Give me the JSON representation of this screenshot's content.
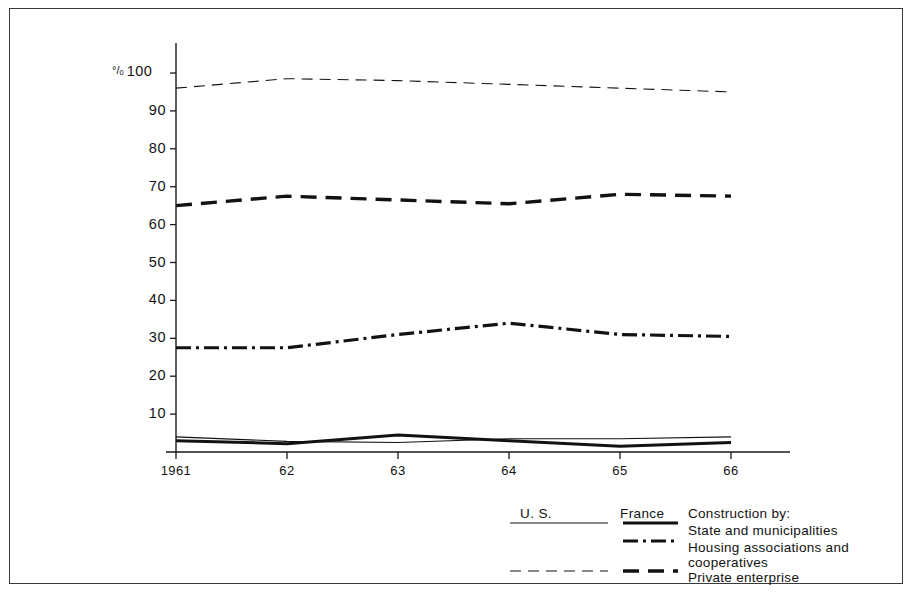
{
  "chart_data": {
    "type": "line",
    "title": "",
    "xlabel": "",
    "ylabel": "%",
    "y_axis_unit_label": "%",
    "categories": [
      "1961",
      "62",
      "63",
      "64",
      "65",
      "66"
    ],
    "x": [
      1961,
      1962,
      1963,
      1964,
      1965,
      1966
    ],
    "ylim": [
      0,
      100
    ],
    "yticks": [
      10,
      20,
      30,
      40,
      50,
      60,
      70,
      80,
      90,
      100
    ],
    "ytick_labels": [
      "10",
      "20",
      "30",
      "40",
      "50",
      "60",
      "70",
      "80",
      "90",
      "100"
    ],
    "grid": false,
    "legend_position": "bottom-right",
    "series": [
      {
        "name": "U.S. — State and municipalities",
        "country": "U.S.",
        "category": "State and municipalities",
        "style": "thin-solid",
        "values": [
          4.0,
          2.8,
          2.5,
          3.5,
          3.5,
          4.0
        ]
      },
      {
        "name": "U.S. — Private enterprise",
        "country": "U.S.",
        "category": "Private enterprise",
        "style": "thin-dashed",
        "values": [
          96.0,
          98.5,
          98.0,
          97.0,
          96.0,
          95.0
        ]
      },
      {
        "name": "France — State and municipalities",
        "country": "France",
        "category": "State and municipalities",
        "style": "thick-solid",
        "values": [
          3.0,
          2.2,
          4.5,
          3.0,
          1.5,
          2.5
        ]
      },
      {
        "name": "France — Housing associations and cooperatives",
        "country": "France",
        "category": "Housing associations and cooperatives",
        "style": "dash-dot",
        "values": [
          27.5,
          27.5,
          31.0,
          34.0,
          31.0,
          30.5
        ]
      },
      {
        "name": "France — Private enterprise",
        "country": "France",
        "category": "Private enterprise",
        "style": "thick-dashed",
        "values": [
          65.0,
          67.5,
          66.5,
          65.5,
          68.0,
          67.5
        ]
      }
    ]
  },
  "legend": {
    "col_us": "U. S.",
    "col_france": "France",
    "heading": "Construction by:",
    "rows": [
      {
        "label_line1": "State and municipalities",
        "label_line2": ""
      },
      {
        "label_line1": "Housing  associations  and",
        "label_line2": "cooperatives"
      },
      {
        "label_line1": "Private  enterprise",
        "label_line2": ""
      }
    ]
  },
  "colors": {
    "ink": "#121212",
    "axis": "#1a1a1a",
    "frame": "#3a3a3a",
    "background": "#ffffff"
  }
}
